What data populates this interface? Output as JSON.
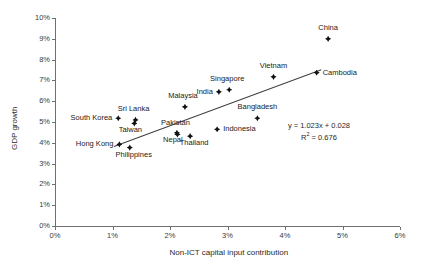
{
  "chart_data": {
    "type": "scatter",
    "title": "",
    "xlabel": "Non-ICT capital input contribution",
    "ylabel": "GDP growth",
    "xlim": [
      0,
      6
    ],
    "ylim": [
      0,
      10
    ],
    "x_tick_labels": [
      "0%",
      "1%",
      "2%",
      "3%",
      "4%",
      "5%",
      "6%"
    ],
    "y_tick_labels": [
      "0%",
      "1%",
      "2%",
      "3%",
      "4%",
      "5%",
      "6%",
      "7%",
      "8%",
      "9%",
      "10%"
    ],
    "grid": false,
    "legend": "none",
    "points": [
      {
        "label": "South Korea",
        "x": 1.1,
        "y": 5.18,
        "label_pos": "left"
      },
      {
        "label": "Hong Kong",
        "x": 1.12,
        "y": 3.92,
        "label_pos": "left"
      },
      {
        "label": "Philippines",
        "x": 1.3,
        "y": 3.77,
        "label_pos": "below-right"
      },
      {
        "label": "Taiwan",
        "x": 1.38,
        "y": 4.93,
        "label_pos": "below-left"
      },
      {
        "label": "Sri Lanka",
        "x": 1.4,
        "y": 5.1,
        "label_pos": "above-left"
      },
      {
        "label": "Nepal",
        "x": 2.12,
        "y": 4.48,
        "label_pos": "below-left"
      },
      {
        "label": "Pakistan",
        "x": 2.13,
        "y": 4.4,
        "label_pos": "above-left"
      },
      {
        "label": "Malaysia",
        "x": 2.26,
        "y": 5.73,
        "label_pos": "above-left"
      },
      {
        "label": "Thailand",
        "x": 2.35,
        "y": 4.32,
        "label_pos": "below-right"
      },
      {
        "label": "Indonesia",
        "x": 2.82,
        "y": 4.65,
        "label_pos": "right"
      },
      {
        "label": "India",
        "x": 2.85,
        "y": 6.45,
        "label_pos": "left"
      },
      {
        "label": "Singapore",
        "x": 3.03,
        "y": 6.55,
        "label_pos": "above-left"
      },
      {
        "label": "Bangladesh",
        "x": 3.52,
        "y": 5.18,
        "label_pos": "above"
      },
      {
        "label": "Vietnam",
        "x": 3.8,
        "y": 7.17,
        "label_pos": "above"
      },
      {
        "label": "Cambodia",
        "x": 4.55,
        "y": 7.37,
        "label_pos": "right"
      },
      {
        "label": "China",
        "x": 4.75,
        "y": 9.0,
        "label_pos": "above"
      }
    ],
    "trendline": {
      "slope": 1.023,
      "intercept": 0.028,
      "r_squared": 0.676,
      "equation_text": "y = 1.023x + 0.028",
      "r2_prefix": "R",
      "r2_exponent": "2",
      "r2_text": " = 0.676",
      "x_start": 1.02,
      "x_end": 4.62
    },
    "colors": {
      "marker": "#111111",
      "trendline": "#3f3f3f",
      "axis": "#6f6f6f",
      "text": "#1a1a1a",
      "background": "#ffffff"
    }
  }
}
